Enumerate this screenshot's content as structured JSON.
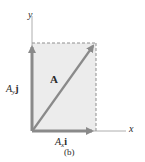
{
  "figure": {
    "caption": "(b)",
    "colors": {
      "background": "#ffffff",
      "rect_fill": "#ececec",
      "vector_color": "#8a8a8a",
      "axis_color": "#9a9a9a",
      "dash_color": "#8f8f8f",
      "text_color": "#2a2a2a"
    },
    "axes": {
      "x_label": "x",
      "y_label": "y"
    },
    "vectors": {
      "resultant": {
        "label": "A"
      },
      "x_component": {
        "symbol": "A",
        "subscript": "x",
        "unit": "i"
      },
      "y_component": {
        "symbol": "A",
        "subscript": "y",
        "unit": "j"
      }
    }
  }
}
